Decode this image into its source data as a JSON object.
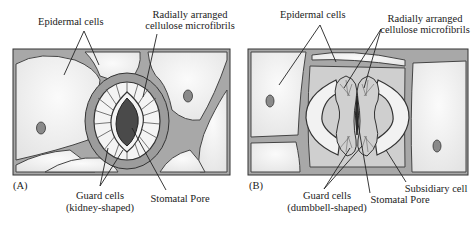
{
  "panel_a": {
    "tag": "(A)",
    "labels": {
      "epidermal": "Epidermal cells",
      "microfibrils_line1": "Radially arranged",
      "microfibrils_line2": "cellulose microfibrils",
      "guard_line1": "Guard cells",
      "guard_line2": "(kidney-shaped)",
      "pore": "Stomatal Pore"
    }
  },
  "panel_b": {
    "tag": "(B)",
    "labels": {
      "epidermal": "Epidermal cells",
      "microfibrils_line1": "Radially arranged",
      "microfibrils_line2": "cellulose microfibrils",
      "guard_line1": "Guard cells",
      "guard_line2": "(dumbbell-shaped)",
      "pore": "Stomatal Pore",
      "subsidiary": "Subsidiary cell"
    }
  },
  "colors": {
    "cell_wall": "#9a9a9a",
    "cell_fill": "#efefef",
    "outline": "#333333",
    "pore": "#4a4a4a",
    "nucleus": "#8a8a8a"
  }
}
